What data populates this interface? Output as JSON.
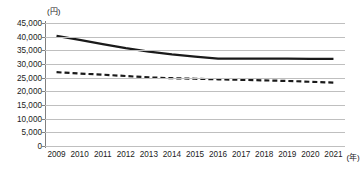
{
  "chart_data": {
    "type": "line",
    "title": "",
    "xlabel": "(年)",
    "ylabel": "(円)",
    "y_unit_label": "(円)",
    "x_unit_label": "(年)",
    "categories": [
      "2009",
      "2010",
      "2011",
      "2012",
      "2013",
      "2014",
      "2015",
      "2016",
      "2017",
      "2018",
      "2019",
      "2020",
      "2021"
    ],
    "ylim": [
      0,
      45000
    ],
    "y_ticks": [
      "45,000",
      "40,000",
      "35,000",
      "30,000",
      "25,000",
      "20,000",
      "15,000",
      "10,000",
      "5,000",
      "0"
    ],
    "y_tick_values": [
      45000,
      40000,
      35000,
      30000,
      25000,
      20000,
      15000,
      10000,
      5000,
      0
    ],
    "grid": true,
    "legend": "none",
    "series": [
      {
        "name": "solid-series",
        "style": "solid",
        "color": "#1a1a1a",
        "values": [
          40300,
          38800,
          37300,
          35800,
          34500,
          33500,
          32700,
          32000,
          31950,
          31950,
          31950,
          31900,
          31850
        ]
      },
      {
        "name": "dashed-series",
        "style": "dashed",
        "color": "#1a1a1a",
        "values": [
          27000,
          26500,
          26100,
          25600,
          25100,
          24800,
          24600,
          24400,
          24200,
          24000,
          23800,
          23500,
          23200
        ]
      }
    ]
  }
}
